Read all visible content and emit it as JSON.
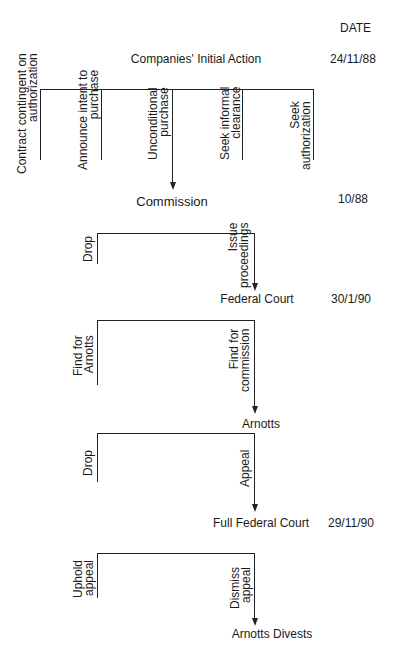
{
  "header": {
    "date_column_label": "DATE"
  },
  "stages": [
    {
      "node": "Companies' Initial Action",
      "date": "24/11/88",
      "branches": [
        {
          "label_lines": [
            "Contract contingent on",
            "authorization"
          ],
          "leads_to_next": false
        },
        {
          "label_lines": [
            "Announce intent to",
            "purchase"
          ],
          "leads_to_next": false
        },
        {
          "label_lines": [
            "Unconditional",
            "purchase"
          ],
          "leads_to_next": true
        },
        {
          "label_lines": [
            "Seek informal",
            "clearance"
          ],
          "leads_to_next": false
        },
        {
          "label_lines": [
            "Seek",
            "authorization"
          ],
          "leads_to_next": false
        }
      ]
    },
    {
      "node": "Commission",
      "date": "10/88",
      "branches": [
        {
          "label_lines": [
            "Drop"
          ],
          "leads_to_next": false
        },
        {
          "label_lines": [
            "Issue",
            "proceedings"
          ],
          "leads_to_next": true
        }
      ]
    },
    {
      "node": "Federal Court",
      "date": "30/1/90",
      "branches": [
        {
          "label_lines": [
            "Find for",
            "Arnotts"
          ],
          "leads_to_next": false
        },
        {
          "label_lines": [
            "Find for",
            "commission"
          ],
          "leads_to_next": true
        }
      ]
    },
    {
      "node": "Arnotts",
      "date": "",
      "branches": [
        {
          "label_lines": [
            "Drop"
          ],
          "leads_to_next": false
        },
        {
          "label_lines": [
            "Appeal"
          ],
          "leads_to_next": true
        }
      ]
    },
    {
      "node": "Full Federal Court",
      "date": "29/11/90",
      "branches": [
        {
          "label_lines": [
            "Uphold",
            "appeal"
          ],
          "leads_to_next": false
        },
        {
          "label_lines": [
            "Dismiss",
            "appeal"
          ],
          "leads_to_next": true
        }
      ]
    },
    {
      "node": "Arnotts Divests",
      "date": "",
      "branches": []
    }
  ],
  "colors": {
    "line": "#222222",
    "text": "#1a1a1a",
    "background": "#ffffff"
  }
}
